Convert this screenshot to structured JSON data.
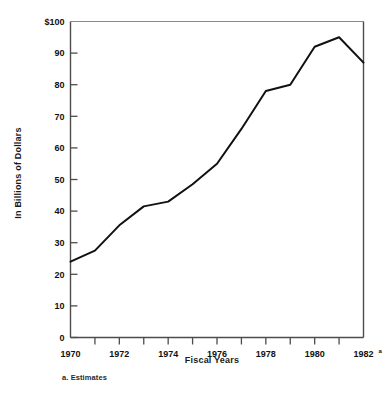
{
  "chart_data": {
    "type": "line",
    "title": "",
    "subtitle": "",
    "xlabel": "Fiscal Years",
    "ylabel": "In Billions of Dollars",
    "x": [
      1970,
      1971,
      1972,
      1973,
      1974,
      1975,
      1976,
      1977,
      1978,
      1979,
      1980,
      1981,
      1982
    ],
    "values": [
      24,
      27.5,
      35.5,
      41.5,
      43,
      48.5,
      55,
      66,
      78,
      80,
      92,
      95,
      87
    ],
    "series": [
      {
        "name": "",
        "values": [
          24,
          27.5,
          35.5,
          41.5,
          43,
          48.5,
          55,
          66,
          78,
          80,
          92,
          95,
          87
        ]
      }
    ],
    "xlim": [
      1970,
      1982
    ],
    "ylim": [
      0,
      100
    ],
    "ytick_values": [
      0,
      10,
      20,
      30,
      40,
      50,
      60,
      70,
      80,
      90,
      100
    ],
    "ytick_labels": [
      "0",
      "10",
      "20",
      "30",
      "40",
      "50",
      "60",
      "70",
      "80",
      "90",
      "$100"
    ],
    "xtick_values": [
      1970,
      1971,
      1972,
      1973,
      1974,
      1975,
      1976,
      1977,
      1978,
      1979,
      1980,
      1981,
      1982
    ],
    "xtick_labels": [
      "1970",
      "",
      "1972",
      "",
      "1974",
      "",
      "1976",
      "",
      "1978",
      "",
      "1980",
      "",
      "1982"
    ],
    "xtick_label_superscripts": [
      "",
      "",
      "",
      "",
      "",
      "",
      "",
      "",
      "",
      "",
      "",
      "",
      "a"
    ],
    "grid": false,
    "legend": "none",
    "line_color": "#111111",
    "axis_color": "#4d4d4d",
    "footnote": "a.  Estimates"
  },
  "axes": {
    "y_title": "In Billions of Dollars",
    "x_title": "Fiscal Years"
  },
  "footnote": {
    "text": "a.  Estimates"
  }
}
